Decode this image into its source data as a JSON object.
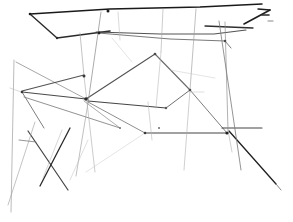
{
  "artwork": {
    "title": "Abstract straight-line pencil sketch",
    "medium": "graphite-line-drawing",
    "background_color": "#ffffff",
    "canvas": {
      "width": 293,
      "height": 222
    },
    "ink_colors": {
      "darkest": "#1a1a1a",
      "dark": "#3a3a3a",
      "mid": "#5e5e5e",
      "light": "#8e8e8e",
      "faint": "#b4b4b4",
      "very_faint": "#cfcfcf"
    }
  },
  "strokes": [
    {
      "name": "top-band-upper-edge",
      "points": "30,14 110,9 200,7 262,4",
      "color": "#1a1a1a",
      "width": 1.5,
      "opacity": 1
    },
    {
      "name": "top-band-left-chevron-upper",
      "points": "30,14 57,38",
      "color": "#2a2a2a",
      "width": 1.4,
      "opacity": 1
    },
    {
      "name": "top-band-left-chevron-lower",
      "points": "57,38 110,31",
      "color": "#2a2a2a",
      "width": 1.6,
      "opacity": 1
    },
    {
      "name": "top-band-lower-edge",
      "points": "96,32 160,34 214,34 246,30",
      "color": "#4a4a4a",
      "width": 1.1,
      "opacity": 0.95
    },
    {
      "name": "top-right-arrow-stroke",
      "points": "244,24 270,10",
      "color": "#1f1f1f",
      "width": 1.6,
      "opacity": 1
    },
    {
      "name": "top-right-arrow-barb",
      "points": "270,10 258,9",
      "color": "#1f1f1f",
      "width": 1.4,
      "opacity": 1
    },
    {
      "name": "top-right-tick-a",
      "points": "262,15 269,15",
      "color": "#2a2a2a",
      "width": 1.6,
      "opacity": 1
    },
    {
      "name": "top-right-tick-b",
      "points": "268,21 273,21",
      "color": "#6a6a6a",
      "width": 1.1,
      "opacity": 0.8
    },
    {
      "name": "band-secondary-right",
      "points": "205,26 253,28",
      "color": "#2f2f2f",
      "width": 1.3,
      "opacity": 1
    },
    {
      "name": "upper-sweep-left-to-right",
      "points": "98,33 170,39 225,41",
      "color": "#6a6a6a",
      "width": 1.0,
      "opacity": 0.9
    },
    {
      "name": "upper-sweep-continuation",
      "points": "225,41 231,48",
      "color": "#6a6a6a",
      "width": 1.0,
      "opacity": 0.9
    },
    {
      "name": "long-diagonal-topleft-to-hub",
      "points": "16,62 86,99",
      "color": "#8a8a8a",
      "width": 0.9,
      "opacity": 0.85
    },
    {
      "name": "hub-left-upper-edge",
      "points": "22,91 84,75",
      "color": "#4a4a4a",
      "width": 1.1,
      "opacity": 0.95
    },
    {
      "name": "hub-left-lower-edge",
      "points": "22,92 86,99",
      "color": "#3f3f3f",
      "width": 1.2,
      "opacity": 0.95
    },
    {
      "name": "left-node-descender",
      "points": "22,92 44,128",
      "color": "#6f6f6f",
      "width": 1.0,
      "opacity": 0.9
    },
    {
      "name": "quad-top-left-edge",
      "points": "86,99 155,54",
      "color": "#4a4a4a",
      "width": 1.1,
      "opacity": 0.95
    },
    {
      "name": "quad-top-right-edge",
      "points": "155,54 190,90",
      "color": "#5a5a5a",
      "width": 1.1,
      "opacity": 0.9
    },
    {
      "name": "quad-right-edge",
      "points": "190,90 166,108",
      "color": "#5f5f5f",
      "width": 1.0,
      "opacity": 0.9
    },
    {
      "name": "quad-bottom-edge",
      "points": "166,108 88,101",
      "color": "#3a3a3a",
      "width": 1.2,
      "opacity": 0.95
    },
    {
      "name": "hub-to-lower-right-node",
      "points": "88,102 145,133",
      "color": "#7a7a7a",
      "width": 1.0,
      "opacity": 0.85
    },
    {
      "name": "lower-quad-bottom-edge",
      "points": "145,133 227,133",
      "color": "#3a3a3a",
      "width": 1.2,
      "opacity": 0.95
    },
    {
      "name": "lower-quad-right-rise",
      "points": "227,133 190,90",
      "color": "#6a6a6a",
      "width": 1.0,
      "opacity": 0.88
    },
    {
      "name": "lower-left-triangle-edge",
      "points": "24,97 120,128",
      "color": "#7f7f7f",
      "width": 1.0,
      "opacity": 0.85
    },
    {
      "name": "lower-left-triangle-return",
      "points": "120,128 84,101",
      "color": "#8a8a8a",
      "width": 0.9,
      "opacity": 0.8
    },
    {
      "name": "right-node-horizontal",
      "points": "222,128 262,128",
      "color": "#3a3a3a",
      "width": 1.2,
      "opacity": 0.95
    },
    {
      "name": "right-node-dark-diagonal",
      "points": "229,131 276,184",
      "color": "#1f1f1f",
      "width": 1.3,
      "opacity": 1
    },
    {
      "name": "right-node-tail",
      "points": "276,184 281,190",
      "color": "#6a6a6a",
      "width": 1.0,
      "opacity": 0.8
    },
    {
      "name": "vertical-dashed-a",
      "points": "101,12 88,103",
      "color": "#8a8a8a",
      "width": 0.9,
      "opacity": 0.8
    },
    {
      "name": "vertical-dashed-a-lower",
      "points": "88,103 76,176",
      "color": "#9a9a9a",
      "width": 0.9,
      "opacity": 0.7
    },
    {
      "name": "vertical-dashed-b",
      "points": "80,33 84,76",
      "color": "#a0a0a0",
      "width": 0.9,
      "opacity": 0.7
    },
    {
      "name": "vertical-dashed-b-lower",
      "points": "84,76 95,172",
      "color": "#a8a8a8",
      "width": 0.9,
      "opacity": 0.65
    },
    {
      "name": "vertical-dashed-c",
      "points": "163,9 161,52",
      "color": "#a8a8a8",
      "width": 0.9,
      "opacity": 0.65
    },
    {
      "name": "vertical-dashed-c-lower",
      "points": "161,52 156,108",
      "color": "#b0b0b0",
      "width": 0.9,
      "opacity": 0.6
    },
    {
      "name": "vertical-dashed-d",
      "points": "196,9 190,90",
      "color": "#9a9a9a",
      "width": 0.9,
      "opacity": 0.7
    },
    {
      "name": "vertical-dashed-d-lower",
      "points": "190,90 184,170",
      "color": "#a8a8a8",
      "width": 0.9,
      "opacity": 0.6
    },
    {
      "name": "vertical-dashed-e",
      "points": "225,22 228,130",
      "color": "#8a8a8a",
      "width": 0.9,
      "opacity": 0.75
    },
    {
      "name": "vertical-dashed-e-lower",
      "points": "228,130 232,152",
      "color": "#a8a8a8",
      "width": 0.9,
      "opacity": 0.6
    },
    {
      "name": "vertical-long-right",
      "points": "219,21 241,170",
      "color": "#7a7a7a",
      "width": 1.0,
      "opacity": 0.8
    },
    {
      "name": "vertical-dashed-f",
      "points": "148,102 152,140",
      "color": "#b0b0b0",
      "width": 0.9,
      "opacity": 0.6
    },
    {
      "name": "vertical-dashed-g",
      "points": "118,12 120,40",
      "color": "#b4b4b4",
      "width": 0.9,
      "opacity": 0.55
    },
    {
      "name": "dark-x-stroke-left",
      "points": "28,131 68,190",
      "color": "#3a3a3a",
      "width": 1.2,
      "opacity": 0.95
    },
    {
      "name": "dark-x-stroke-right",
      "points": "70,128 40,186",
      "color": "#2a2a2a",
      "width": 1.3,
      "opacity": 1
    },
    {
      "name": "long-left-descender",
      "points": "14,60 11,212",
      "color": "#9a9a9a",
      "width": 0.9,
      "opacity": 0.75
    },
    {
      "name": "long-left-descender-b",
      "points": "35,122 8,205",
      "color": "#a0a0a0",
      "width": 0.9,
      "opacity": 0.7
    },
    {
      "name": "short-left-tick",
      "points": "19,140 36,142",
      "color": "#7a7a7a",
      "width": 1.0,
      "opacity": 0.8
    },
    {
      "name": "bottom-left-faint-a",
      "points": "62,130 43,178",
      "color": "#b4b4b4",
      "width": 0.9,
      "opacity": 0.6
    },
    {
      "name": "bottom-left-faint-b",
      "points": "88,140 70,180",
      "color": "#bcbcbc",
      "width": 0.9,
      "opacity": 0.55
    },
    {
      "name": "bottom-center-faint-diag",
      "points": "145,133 86,172",
      "color": "#c4c4c4",
      "width": 0.9,
      "opacity": 0.5
    },
    {
      "name": "faint-right-mid-a",
      "points": "170,70 215,78",
      "color": "#c4c4c4",
      "width": 0.9,
      "opacity": 0.5
    },
    {
      "name": "faint-right-mid-b",
      "points": "190,92 204,92",
      "color": "#bcbcbc",
      "width": 0.9,
      "opacity": 0.55
    },
    {
      "name": "faint-left-mid-a",
      "points": "10,88 24,93",
      "color": "#b4b4b4",
      "width": 0.9,
      "opacity": 0.55
    },
    {
      "name": "faint-upper-center",
      "points": "112,38 132,62",
      "color": "#c0c0c0",
      "width": 0.9,
      "opacity": 0.5
    }
  ],
  "nodes": [
    {
      "name": "node-top-band-left",
      "x": 30,
      "y": 14,
      "r": 1.3,
      "color": "#1a1a1a"
    },
    {
      "name": "node-top-band-apex",
      "x": 57,
      "y": 38,
      "r": 1.2,
      "color": "#2a2a2a"
    },
    {
      "name": "node-top-band-mid",
      "x": 108,
      "y": 11,
      "r": 1.5,
      "color": "#1a1a1a"
    },
    {
      "name": "node-band-lower-left",
      "x": 99,
      "y": 33,
      "r": 1.4,
      "color": "#1f1f1f"
    },
    {
      "name": "node-hub-center",
      "x": 86,
      "y": 99,
      "r": 1.8,
      "color": "#2a2a2a"
    },
    {
      "name": "node-hub-upper",
      "x": 84,
      "y": 76,
      "r": 1.5,
      "color": "#3a3a3a"
    },
    {
      "name": "node-left-edge",
      "x": 22,
      "y": 92,
      "r": 1.3,
      "color": "#3a3a3a"
    },
    {
      "name": "node-quad-top",
      "x": 155,
      "y": 54,
      "r": 1.3,
      "color": "#4a4a4a"
    },
    {
      "name": "node-quad-right",
      "x": 190,
      "y": 90,
      "r": 1.3,
      "color": "#4a4a4a"
    },
    {
      "name": "node-quad-bottom-right",
      "x": 166,
      "y": 108,
      "r": 1.2,
      "color": "#5a5a5a"
    },
    {
      "name": "node-lower-quad-bottom",
      "x": 145,
      "y": 133,
      "r": 1.3,
      "color": "#3a3a3a"
    },
    {
      "name": "node-right-hub",
      "x": 227,
      "y": 133,
      "r": 1.6,
      "color": "#1f1f1f"
    },
    {
      "name": "node-upper-right",
      "x": 225,
      "y": 41,
      "r": 1.3,
      "color": "#4a4a4a"
    },
    {
      "name": "node-bottom-dot",
      "x": 159,
      "y": 128,
      "r": 1.0,
      "color": "#6a6a6a"
    },
    {
      "name": "node-mid-dot",
      "x": 120,
      "y": 128,
      "r": 1.0,
      "color": "#7a7a7a"
    }
  ]
}
